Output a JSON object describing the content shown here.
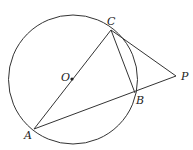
{
  "diagram": {
    "type": "geometry",
    "circle": {
      "center_label": "O",
      "cx": 73,
      "cy": 79.5,
      "r": 64.5
    },
    "points": {
      "C": {
        "label": "C",
        "x": 111,
        "y": 30
      },
      "A": {
        "label": "A",
        "x": 34,
        "y": 129
      },
      "O": {
        "label": "O",
        "x": 72,
        "y": 79
      },
      "B": {
        "label": "B",
        "x": 135,
        "y": 93
      },
      "P": {
        "label": "P",
        "x": 176,
        "y": 76
      }
    },
    "segments": [
      "AC",
      "AP",
      "CB",
      "CP"
    ]
  }
}
